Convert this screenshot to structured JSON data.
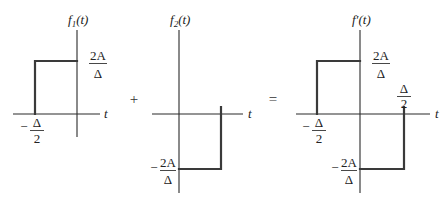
{
  "figure": {
    "type": "signal-sum-diagram",
    "operators": {
      "plus": "+",
      "equals": "="
    },
    "panels": [
      {
        "id": "f1",
        "title": {
          "func": "f",
          "sub": "1",
          "arg": "(t)"
        },
        "t_axis_label": "t",
        "amplitude_label": {
          "num": "2A",
          "den": "Δ"
        },
        "edge_label": {
          "sign": "−",
          "num": "Δ",
          "den": "2"
        },
        "pulse": {
          "from": "-Δ/2",
          "to": "0",
          "height": "2A/Δ"
        }
      },
      {
        "id": "f2",
        "title": {
          "func": "f",
          "sub": "2",
          "arg": "(t)"
        },
        "t_axis_label": "t",
        "amplitude_label": {
          "sign": "−",
          "num": "2A",
          "den": "Δ"
        },
        "pulse": {
          "from": "0",
          "to": "Δ/2",
          "height": "-2A/Δ"
        }
      },
      {
        "id": "fprime",
        "title": {
          "func": "f′",
          "arg": "(t)"
        },
        "t_axis_label": "t",
        "pos_amplitude_label": {
          "num": "2A",
          "den": "Δ"
        },
        "neg_amplitude_label": {
          "sign": "−",
          "num": "2A",
          "den": "Δ"
        },
        "left_edge_label": {
          "sign": "−",
          "num": "Δ",
          "den": "2"
        },
        "right_edge_label": {
          "num": "Δ",
          "den": "2"
        },
        "pulses": [
          {
            "from": "-Δ/2",
            "to": "0",
            "height": "2A/Δ"
          },
          {
            "from": "0",
            "to": "Δ/2",
            "height": "-2A/Δ"
          }
        ]
      }
    ]
  }
}
